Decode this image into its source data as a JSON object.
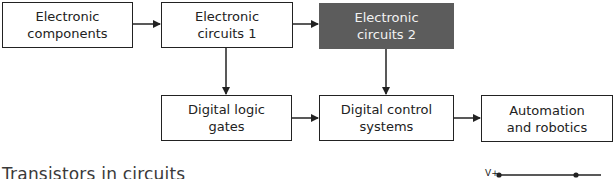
{
  "diagram": {
    "nodes": [
      {
        "id": "electronic-components",
        "label": "Electronic\ncomponents",
        "row": 1,
        "highlighted": false
      },
      {
        "id": "electronic-circuits-1",
        "label": "Electronic\ncircuits 1",
        "row": 1,
        "highlighted": false
      },
      {
        "id": "electronic-circuits-2",
        "label": "Electronic\ncircuits 2",
        "row": 1,
        "highlighted": true
      },
      {
        "id": "digital-logic-gates",
        "label": "Digital logic\ngates",
        "row": 2,
        "highlighted": false
      },
      {
        "id": "digital-control-systems",
        "label": "Digital control\nsystems",
        "row": 2,
        "highlighted": false
      },
      {
        "id": "automation-and-robotics",
        "label": "Automation\nand robotics",
        "row": 2,
        "highlighted": false
      }
    ],
    "edges": [
      {
        "from": "electronic-components",
        "to": "electronic-circuits-1"
      },
      {
        "from": "electronic-circuits-1",
        "to": "electronic-circuits-2"
      },
      {
        "from": "electronic-circuits-1",
        "to": "digital-logic-gates"
      },
      {
        "from": "electronic-circuits-2",
        "to": "digital-control-systems"
      },
      {
        "from": "digital-logic-gates",
        "to": "digital-control-systems"
      },
      {
        "from": "digital-control-systems",
        "to": "automation-and-robotics"
      }
    ],
    "colors": {
      "highlight": "#5c5c5c",
      "line": "#222222"
    }
  },
  "section": {
    "heading": "Transistors in circuits"
  },
  "circuit": {
    "voltage_label": "V+"
  }
}
